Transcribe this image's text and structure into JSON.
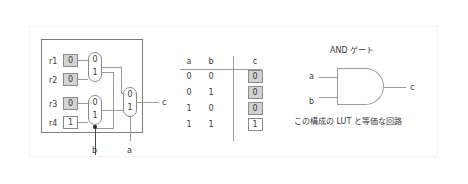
{
  "diagram": {
    "title_hidden": "LUT equivalent AND gate figure",
    "lut": {
      "registers": [
        {
          "label": "r1",
          "value": "0",
          "highlighted": false
        },
        {
          "label": "r2",
          "value": "0",
          "highlighted": false
        },
        {
          "label": "r3",
          "value": "0",
          "highlighted": false
        },
        {
          "label": "r4",
          "value": "1",
          "highlighted": true
        }
      ],
      "mux_top": {
        "sel0": "0",
        "sel1": "1"
      },
      "mux_bottom": {
        "sel0": "0",
        "sel1": "1"
      },
      "mux_out": {
        "sel0": "0",
        "sel1": "1"
      },
      "input_b": "b",
      "input_a": "a",
      "output_c": "c"
    },
    "truth_table": {
      "headers": [
        "a",
        "b",
        "c"
      ],
      "rows": [
        {
          "a": "0",
          "b": "0",
          "c": "0",
          "c_highlighted": false
        },
        {
          "a": "0",
          "b": "1",
          "c": "0",
          "c_highlighted": false
        },
        {
          "a": "1",
          "b": "0",
          "c": "0",
          "c_highlighted": false
        },
        {
          "a": "1",
          "b": "1",
          "c": "1",
          "c_highlighted": true
        }
      ]
    },
    "and_gate": {
      "title": "AND ゲート",
      "input_a": "a",
      "input_b": "b",
      "output_c": "c",
      "caption": "この構成の LUT と等価な回路"
    }
  }
}
